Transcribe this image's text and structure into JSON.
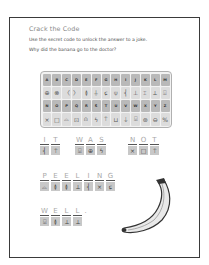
{
  "worksheet": {
    "title": "Crack the Code",
    "instruction": "Use the secret code to unlock the answer to a joke.",
    "question": "Why did the banana go to the doctor?"
  },
  "code_key": {
    "rows": [
      [
        "A",
        "B",
        "C",
        "D",
        "E",
        "F",
        "G",
        "H",
        "I",
        "J",
        "K",
        "L",
        "M"
      ],
      [
        "⊕",
        "⊗",
        "〈",
        "〉",
        "≬",
        "⏚",
        "ɕ",
        "⍦",
        "⎨",
        "⊥",
        "⌶",
        "⟂",
        "⍗"
      ],
      [
        "N",
        "O",
        "P",
        "Q",
        "R",
        "S",
        "T",
        "U",
        "V",
        "W",
        "X",
        "Y",
        "Z"
      ],
      [
        "⨯",
        "□",
        "⌓",
        "⊡",
        "⍝",
        "ϟ",
        "⍑",
        "⊔",
        "⍊",
        "⍌",
        "⊛",
        "⊖",
        "%"
      ]
    ]
  },
  "answer": {
    "words": [
      {
        "letters": [
          "I",
          "T"
        ],
        "symbols": [
          "⎨",
          "⍑"
        ]
      },
      {
        "letters": [
          "W",
          "A",
          "S"
        ],
        "symbols": [
          "⍌",
          "⊕",
          "ϟ"
        ]
      },
      {
        "letters": [
          "N",
          "O",
          "T"
        ],
        "symbols": [
          "⨯",
          "□",
          "⍑"
        ]
      },
      {
        "letters": [
          "P",
          "E",
          "E",
          "L",
          "I",
          "N",
          "G"
        ],
        "symbols": [
          "⌓",
          "≬",
          "≬",
          "⟂",
          "⎨",
          "⨯",
          "ɕ"
        ]
      },
      {
        "letters": [
          "W",
          "E",
          "L",
          "L",
          "."
        ],
        "symbols": [
          "⍌",
          "≬",
          "⟂",
          "⟂",
          ""
        ]
      }
    ]
  },
  "illustration": {
    "subject": "banana"
  }
}
